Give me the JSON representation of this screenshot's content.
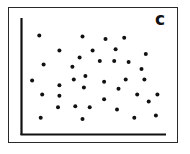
{
  "chart_data": {
    "type": "scatter",
    "title": "",
    "panel_label": "c",
    "xlabel": "",
    "ylabel": "",
    "x_ticks": [],
    "y_ticks": [],
    "grid": false,
    "legend": null,
    "note": "Unlabeled axes; points given in normalized plot coordinates (x: 0=left axis, 100=right end of x-axis; y: 0=x-axis, 100=top of y-axis). Pattern shows no correlation.",
    "xlim": [
      0,
      100
    ],
    "ylim": [
      0,
      100
    ],
    "points": [
      {
        "x": 12,
        "y": 85
      },
      {
        "x": 42,
        "y": 84
      },
      {
        "x": 58,
        "y": 82
      },
      {
        "x": 71,
        "y": 83
      },
      {
        "x": 26,
        "y": 72
      },
      {
        "x": 49,
        "y": 72
      },
      {
        "x": 65,
        "y": 73
      },
      {
        "x": 86,
        "y": 69
      },
      {
        "x": 40,
        "y": 66
      },
      {
        "x": 15,
        "y": 60
      },
      {
        "x": 54,
        "y": 63
      },
      {
        "x": 64,
        "y": 63
      },
      {
        "x": 74,
        "y": 62
      },
      {
        "x": 35,
        "y": 58
      },
      {
        "x": 83,
        "y": 56
      },
      {
        "x": 7,
        "y": 46
      },
      {
        "x": 36,
        "y": 47
      },
      {
        "x": 44,
        "y": 50
      },
      {
        "x": 57,
        "y": 45
      },
      {
        "x": 72,
        "y": 47
      },
      {
        "x": 85,
        "y": 47
      },
      {
        "x": 26,
        "y": 42
      },
      {
        "x": 43,
        "y": 40
      },
      {
        "x": 67,
        "y": 39
      },
      {
        "x": 14,
        "y": 34
      },
      {
        "x": 26,
        "y": 33
      },
      {
        "x": 80,
        "y": 34
      },
      {
        "x": 94,
        "y": 34
      },
      {
        "x": 57,
        "y": 30
      },
      {
        "x": 88,
        "y": 28
      },
      {
        "x": 25,
        "y": 23
      },
      {
        "x": 37,
        "y": 24
      },
      {
        "x": 47,
        "y": 23
      },
      {
        "x": 66,
        "y": 21
      },
      {
        "x": 13,
        "y": 14
      },
      {
        "x": 42,
        "y": 13
      },
      {
        "x": 78,
        "y": 14
      },
      {
        "x": 93,
        "y": 16
      }
    ],
    "marker_color": "#111111",
    "axis_color": "#111111",
    "frame_color": "#2a2a2a"
  },
  "layout": {
    "axis_origin": {
      "x": 22,
      "y": 134
    },
    "x_axis_end": 166,
    "y_axis_top": 18
  }
}
